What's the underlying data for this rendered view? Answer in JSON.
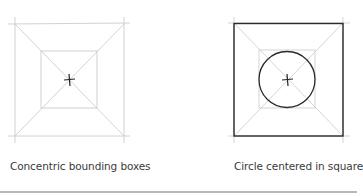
{
  "figures": [
    {
      "id": "concentric",
      "caption": "Concentric bounding boxes",
      "elements": [
        "outer-square-light",
        "inner-square-light",
        "diagonals",
        "center-cross"
      ]
    },
    {
      "id": "circle",
      "caption": "Circle centered in square",
      "elements": [
        "outer-square-dark",
        "inner-square-light",
        "diagonals",
        "circle",
        "center-cross"
      ]
    }
  ],
  "colors": {
    "construction_line": "#c8c8c8",
    "dark_line": "#2a2a2a",
    "caption_text": "#3a3a3a",
    "divider": "#b8b8b8"
  }
}
